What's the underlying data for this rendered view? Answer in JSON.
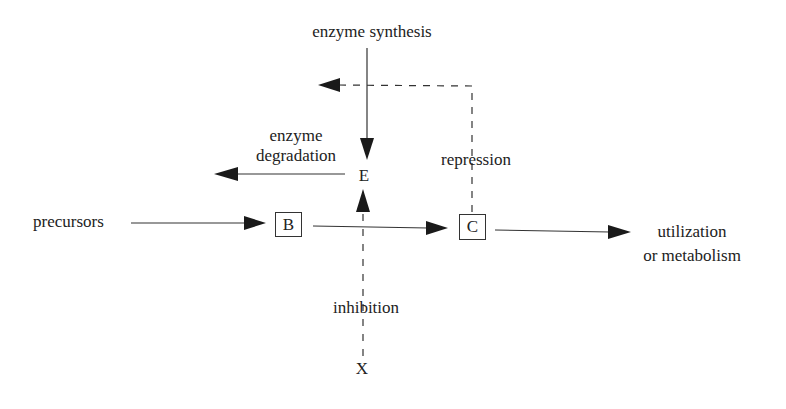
{
  "diagram": {
    "title": "enzyme synthesis",
    "nodes": {
      "E": {
        "label": "E"
      },
      "B": {
        "label": "B",
        "boxed": true
      },
      "C": {
        "label": "C",
        "boxed": true
      },
      "X": {
        "label": "X"
      }
    },
    "labels": {
      "precursors": "precursors",
      "degradation_line1": "enzyme",
      "degradation_line2": "degradation",
      "repression": "repression",
      "inhibition": "inhibition",
      "utilization_line1": "utilization",
      "utilization_line2": "or metabolism"
    },
    "edges": [
      {
        "from": "enzyme synthesis",
        "to": "E",
        "style": "solid"
      },
      {
        "from": "E",
        "to": "enzyme degradation",
        "style": "solid"
      },
      {
        "from": "precursors",
        "to": "B",
        "style": "solid"
      },
      {
        "from": "B",
        "to": "C",
        "style": "solid"
      },
      {
        "from": "C",
        "to": "utilization or metabolism",
        "style": "solid"
      },
      {
        "from": "C",
        "to": "enzyme synthesis",
        "style": "dashed",
        "label": "repression"
      },
      {
        "from": "X",
        "to": "E",
        "style": "dashed",
        "label": "inhibition"
      }
    ],
    "colors": {
      "line": "#333333",
      "text": "#222222",
      "background": "#ffffff"
    }
  }
}
